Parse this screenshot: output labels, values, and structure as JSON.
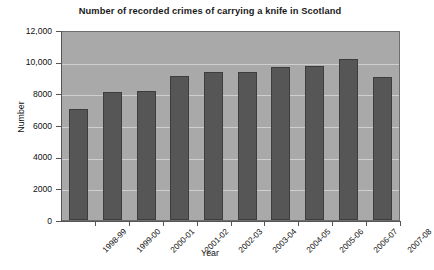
{
  "chart_data": {
    "type": "bar",
    "title": "Number of recorded crimes of carrying a knife in Scotland",
    "xlabel": "Year",
    "ylabel": "Number",
    "categories": [
      "1998-99",
      "1999-00",
      "2000-01",
      "2001-02",
      "2002-03",
      "2003-04",
      "2004-05",
      "2005-06",
      "2006-07",
      "2007-08"
    ],
    "values": [
      7000,
      8100,
      8150,
      9100,
      9350,
      9350,
      9650,
      9700,
      10200,
      9050
    ],
    "ylim": [
      0,
      12000
    ],
    "ytick_values": [
      0,
      2000,
      4000,
      6000,
      8000,
      10000,
      12000
    ],
    "ytick_labels": [
      "0",
      "2000",
      "4000",
      "6000",
      "8000",
      "10,000",
      "12,000"
    ],
    "grid": true,
    "legend": false,
    "bar_color": "#565656",
    "plot_background": "#a9a9a9",
    "gridline_color": "#cfcfcf"
  }
}
